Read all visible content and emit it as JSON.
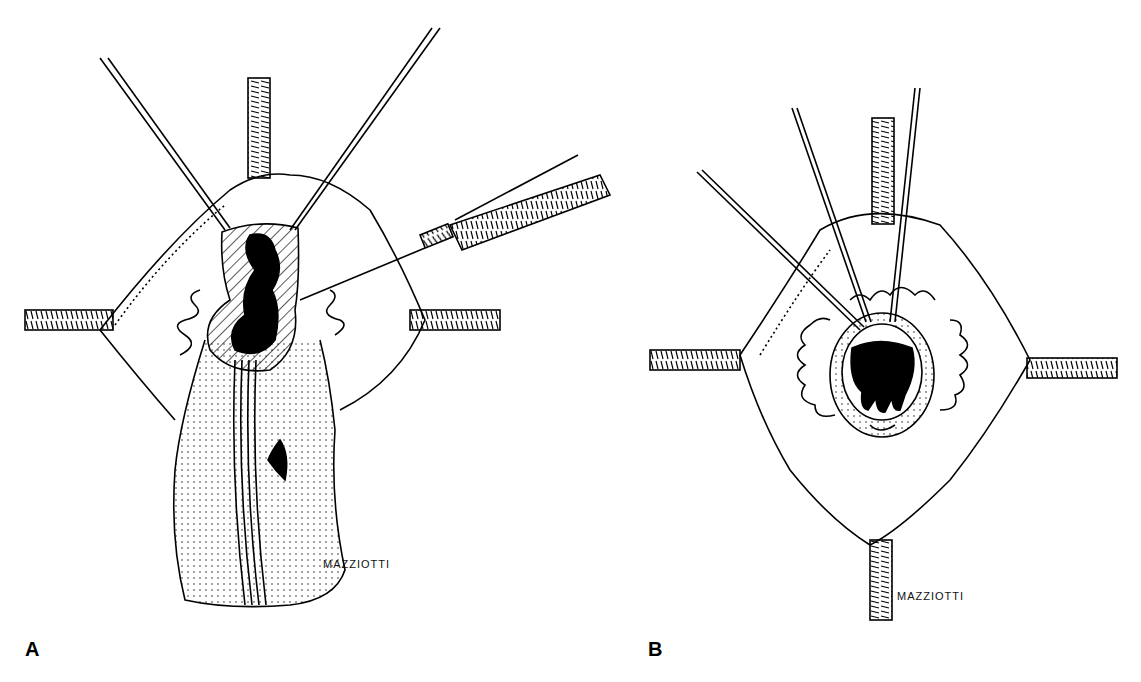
{
  "figure": {
    "panels": [
      {
        "id": "A",
        "label": "A",
        "signature": "MAZZIOTTI"
      },
      {
        "id": "B",
        "label": "B",
        "signature": "MAZZIOTTI"
      }
    ],
    "colors": {
      "ink": "#000000",
      "paper": "#ffffff"
    }
  }
}
